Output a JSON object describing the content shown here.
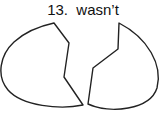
{
  "item": {
    "number": "13.",
    "word": "wasn’t",
    "label": "13.  wasn’t"
  },
  "figure": {
    "pieces": [
      "left-half",
      "right-half"
    ],
    "stroke_color": "#222222",
    "fill_color": "#ffffff"
  }
}
